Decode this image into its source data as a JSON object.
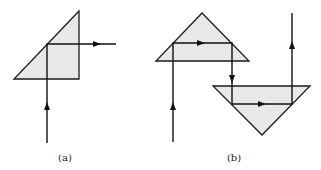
{
  "figure": {
    "colors": {
      "prism_fill": "#e8e8e8",
      "line": "#111111",
      "background": "#ffffff"
    },
    "panels": [
      {
        "id": "a",
        "label": "(a)",
        "prisms": [
          {
            "name": "right-angle-prism",
            "orientation": "hypotenuse facing lower-left"
          }
        ],
        "beam": {
          "segments": [
            "incoming upward",
            "reflected to the right"
          ],
          "arrows": [
            "up",
            "right"
          ]
        }
      },
      {
        "id": "b",
        "label": "(b)",
        "prisms": [
          {
            "name": "upper-prism",
            "orientation": "apex up"
          },
          {
            "name": "lower-prism",
            "orientation": "apex down"
          }
        ],
        "beam": {
          "segments": [
            "incoming upward",
            "right inside upper prism",
            "downward between prisms",
            "right inside lower prism",
            "outgoing upward"
          ],
          "arrows": [
            "up",
            "right",
            "down",
            "right",
            "up"
          ]
        }
      }
    ]
  }
}
